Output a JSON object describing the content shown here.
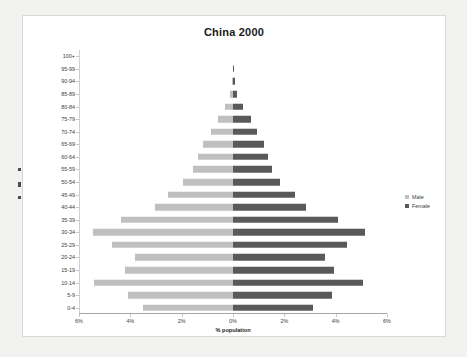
{
  "chart": {
    "title": "China 2000",
    "xlabel": "% population",
    "legend": {
      "male_label": "Male",
      "female_label": "Female",
      "male_color": "#bfbfbf",
      "female_color": "#595959"
    }
  },
  "chart_data": {
    "type": "bar",
    "subtype": "population-pyramid",
    "title": "China 2000",
    "xlabel": "% population",
    "ylabel": "",
    "categories": [
      "0-4",
      "5-9",
      "10-14",
      "15-19",
      "20-24",
      "25-29",
      "30-34",
      "35-39",
      "40-44",
      "45-49",
      "50-54",
      "55-59",
      "60-64",
      "65-69",
      "70-74",
      "75-79",
      "80-84",
      "85-89",
      "90-94",
      "95-99",
      "100+"
    ],
    "series": [
      {
        "name": "Male",
        "side": "left",
        "color": "#bfbfbf",
        "values": [
          3.5,
          4.1,
          5.4,
          4.2,
          3.8,
          4.7,
          5.45,
          4.35,
          3.05,
          2.55,
          1.95,
          1.55,
          1.35,
          1.15,
          0.85,
          0.6,
          0.3,
          0.12,
          0.04,
          0.01,
          0.0
        ]
      },
      {
        "name": "Female",
        "side": "right",
        "color": "#595959",
        "values": [
          3.1,
          3.85,
          5.05,
          3.95,
          3.6,
          4.45,
          5.15,
          4.1,
          2.85,
          2.4,
          1.85,
          1.5,
          1.35,
          1.2,
          0.95,
          0.7,
          0.4,
          0.17,
          0.06,
          0.015,
          0.0
        ]
      }
    ],
    "xticks": [
      {
        "label": "6%",
        "value": -6
      },
      {
        "label": "4%",
        "value": -4
      },
      {
        "label": "2%",
        "value": -2
      },
      {
        "label": "0%",
        "value": 0
      },
      {
        "label": "2%",
        "value": 2
      },
      {
        "label": "4%",
        "value": 4
      },
      {
        "label": "6%",
        "value": 6
      }
    ],
    "xlim": [
      -6,
      6
    ],
    "grid": false,
    "legend_position": "right"
  }
}
